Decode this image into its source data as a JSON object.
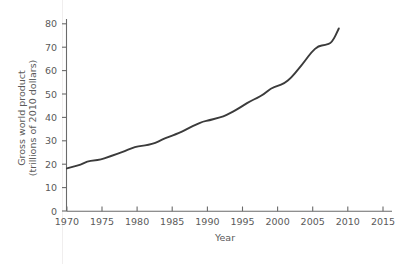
{
  "chart_data": {
    "type": "line",
    "title": "",
    "subtitle": "",
    "xlabel": "Year",
    "ylabel": "Gross world product\n(trillions of 2010 dollars)",
    "ylabel_line1": "Gross world product",
    "ylabel_line2": "(trillions of 2010 dollars)",
    "xlim": [
      1970,
      2016.5
    ],
    "ylim": [
      0,
      84
    ],
    "xticks": [
      1970,
      1975,
      1980,
      1985,
      1990,
      1995,
      2000,
      2005,
      2010,
      2015
    ],
    "xtick_labels": [
      "1970",
      "1975",
      "1980",
      "1985",
      "1990",
      "1995",
      "2000",
      "2005",
      "2010",
      "2015"
    ],
    "yticks": [
      0,
      10,
      20,
      30,
      40,
      50,
      60,
      70,
      80
    ],
    "ytick_labels": [
      "0",
      "10",
      "20",
      "30",
      "40",
      "50",
      "60",
      "70",
      "80"
    ],
    "grid": false,
    "legend": null,
    "line_color": "#3b3b3b",
    "axis_color": "#6a6a6a",
    "text_color": "#5a5a5a",
    "background_color": "#ffffff",
    "series": [
      {
        "name": "Gross world product",
        "x": [
          1970,
          1971,
          1972,
          1973,
          1974,
          1975,
          1976,
          1977,
          1978,
          1979,
          1980,
          1981,
          1982,
          1983,
          1984,
          1985,
          1986,
          1987,
          1988,
          1989,
          1990,
          1991,
          1992,
          1993,
          1994,
          1995,
          1996,
          1997,
          1998,
          1999,
          2000,
          2001,
          2002,
          2003,
          2004,
          2005,
          2006,
          2007,
          2008,
          2009,
          2010
        ],
        "values": [
          18.2,
          19.0,
          19.8,
          21.2,
          21.6,
          22.0,
          23.0,
          24.0,
          25.0,
          26.2,
          27.3,
          27.9,
          28.2,
          29.1,
          30.5,
          31.7,
          32.8,
          34.0,
          35.6,
          37.0,
          38.2,
          38.8,
          39.6,
          40.4,
          41.8,
          43.4,
          45.2,
          47.0,
          48.3,
          50.0,
          52.4,
          53.4,
          54.6,
          57.0,
          60.5,
          64.0,
          68.0,
          70.6,
          70.9,
          71.9,
          78.0
        ]
      }
    ]
  }
}
